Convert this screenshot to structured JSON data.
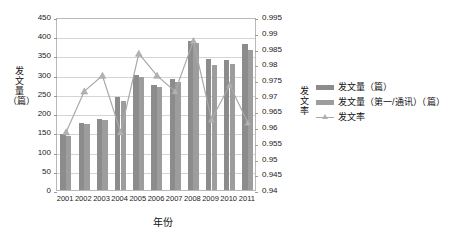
{
  "chart_data": {
    "type": "bar",
    "title": "",
    "subtitle": "",
    "xlabel": "年份",
    "ylabel": "发文量（篇）",
    "y2label": "发文率",
    "categories": [
      "2001",
      "2002",
      "2003",
      "2004",
      "2005",
      "2006",
      "2007",
      "2008",
      "2009",
      "2010",
      "2011"
    ],
    "ylim": [
      0,
      450
    ],
    "yticks": [
      0,
      50,
      100,
      150,
      200,
      250,
      300,
      350,
      400,
      450
    ],
    "y2lim": [
      0.94,
      0.995
    ],
    "y2ticks": [
      0.94,
      0.945,
      0.95,
      0.955,
      0.96,
      0.965,
      0.97,
      0.975,
      0.98,
      0.985,
      0.99,
      0.995
    ],
    "grid": true,
    "legend_position": "right",
    "series": [
      {
        "name": "发文量（篇）",
        "kind": "bar",
        "axis": "left",
        "color": "#8c8c8c",
        "values": [
          146,
          175,
          186,
          241,
          299,
          274,
          288,
          387,
          340,
          338,
          379
        ]
      },
      {
        "name": "发文量（第一/通讯）（篇）",
        "kind": "bar",
        "axis": "left",
        "color": "#9d9d9d",
        "values": [
          140,
          171,
          181,
          231,
          293,
          269,
          280,
          382,
          325,
          329,
          365
        ]
      },
      {
        "name": "发文率",
        "kind": "line",
        "axis": "right",
        "color": "#a9a9a9",
        "values": [
          0.959,
          0.972,
          0.977,
          0.959,
          0.984,
          0.977,
          0.972,
          0.988,
          0.963,
          0.974,
          0.962
        ]
      }
    ]
  },
  "axis": {
    "left_title": "发文量\n（篇）",
    "left_title_lines": [
      "发",
      "文",
      "量",
      "（篇）"
    ],
    "right_title_lines": [
      "发",
      "文",
      "率"
    ],
    "x_title": "年份"
  },
  "legend": {
    "items": [
      {
        "label": "发文量（篇）",
        "marker": "bar-swatch-dark"
      },
      {
        "label": "发文量（第一/通讯）（篇）",
        "marker": "bar-swatch-light"
      },
      {
        "label": "发文率",
        "marker": "line-marker"
      }
    ]
  },
  "colors": {
    "series1": "#8c8c8c",
    "series2": "#9d9d9d",
    "line": "#a9a9a9",
    "grid": "#d4d4d4",
    "frame": "#b9b9b9",
    "text": "#222222"
  }
}
